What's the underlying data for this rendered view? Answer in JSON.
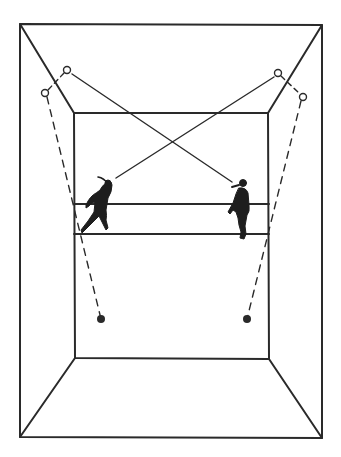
{
  "diagram": {
    "colors": {
      "stroke": "#2a2a2a",
      "background": "#ffffff"
    },
    "outer_wall": {
      "tl": [
        20,
        24
      ],
      "tr": [
        322,
        25
      ],
      "br": [
        322,
        438
      ],
      "bl": [
        20,
        437
      ]
    },
    "front_wall": {
      "tl": [
        74,
        113
      ],
      "tr": [
        268,
        113
      ],
      "br": [
        269,
        359
      ],
      "bl": [
        75,
        358
      ]
    },
    "horizontal_lines": [
      {
        "y": 204
      },
      {
        "y": 234
      }
    ],
    "solid_paths": [
      {
        "from": [
          72,
          74
        ],
        "to": [
          232,
          182
        ],
        "label": "shot path 1"
      },
      {
        "from": [
          274,
          77
        ],
        "to": [
          116,
          178
        ],
        "label": "shot path 2"
      }
    ],
    "dashed_paths": [
      {
        "from": [
          47,
          97
        ],
        "to": [
          101,
          319
        ],
        "label": "return path 1"
      },
      {
        "from": [
          301,
          101
        ],
        "to": [
          247,
          319
        ],
        "label": "return path 2"
      }
    ],
    "open_circles": [
      [
        67,
        70
      ],
      [
        45,
        93
      ],
      [
        278,
        73
      ],
      [
        303,
        97
      ]
    ],
    "filled_dots": [
      [
        101,
        319
      ],
      [
        247,
        319
      ]
    ],
    "players": [
      {
        "name": "left player",
        "x": 100,
        "y": 205
      },
      {
        "name": "right player",
        "x": 240,
        "y": 210
      }
    ]
  }
}
